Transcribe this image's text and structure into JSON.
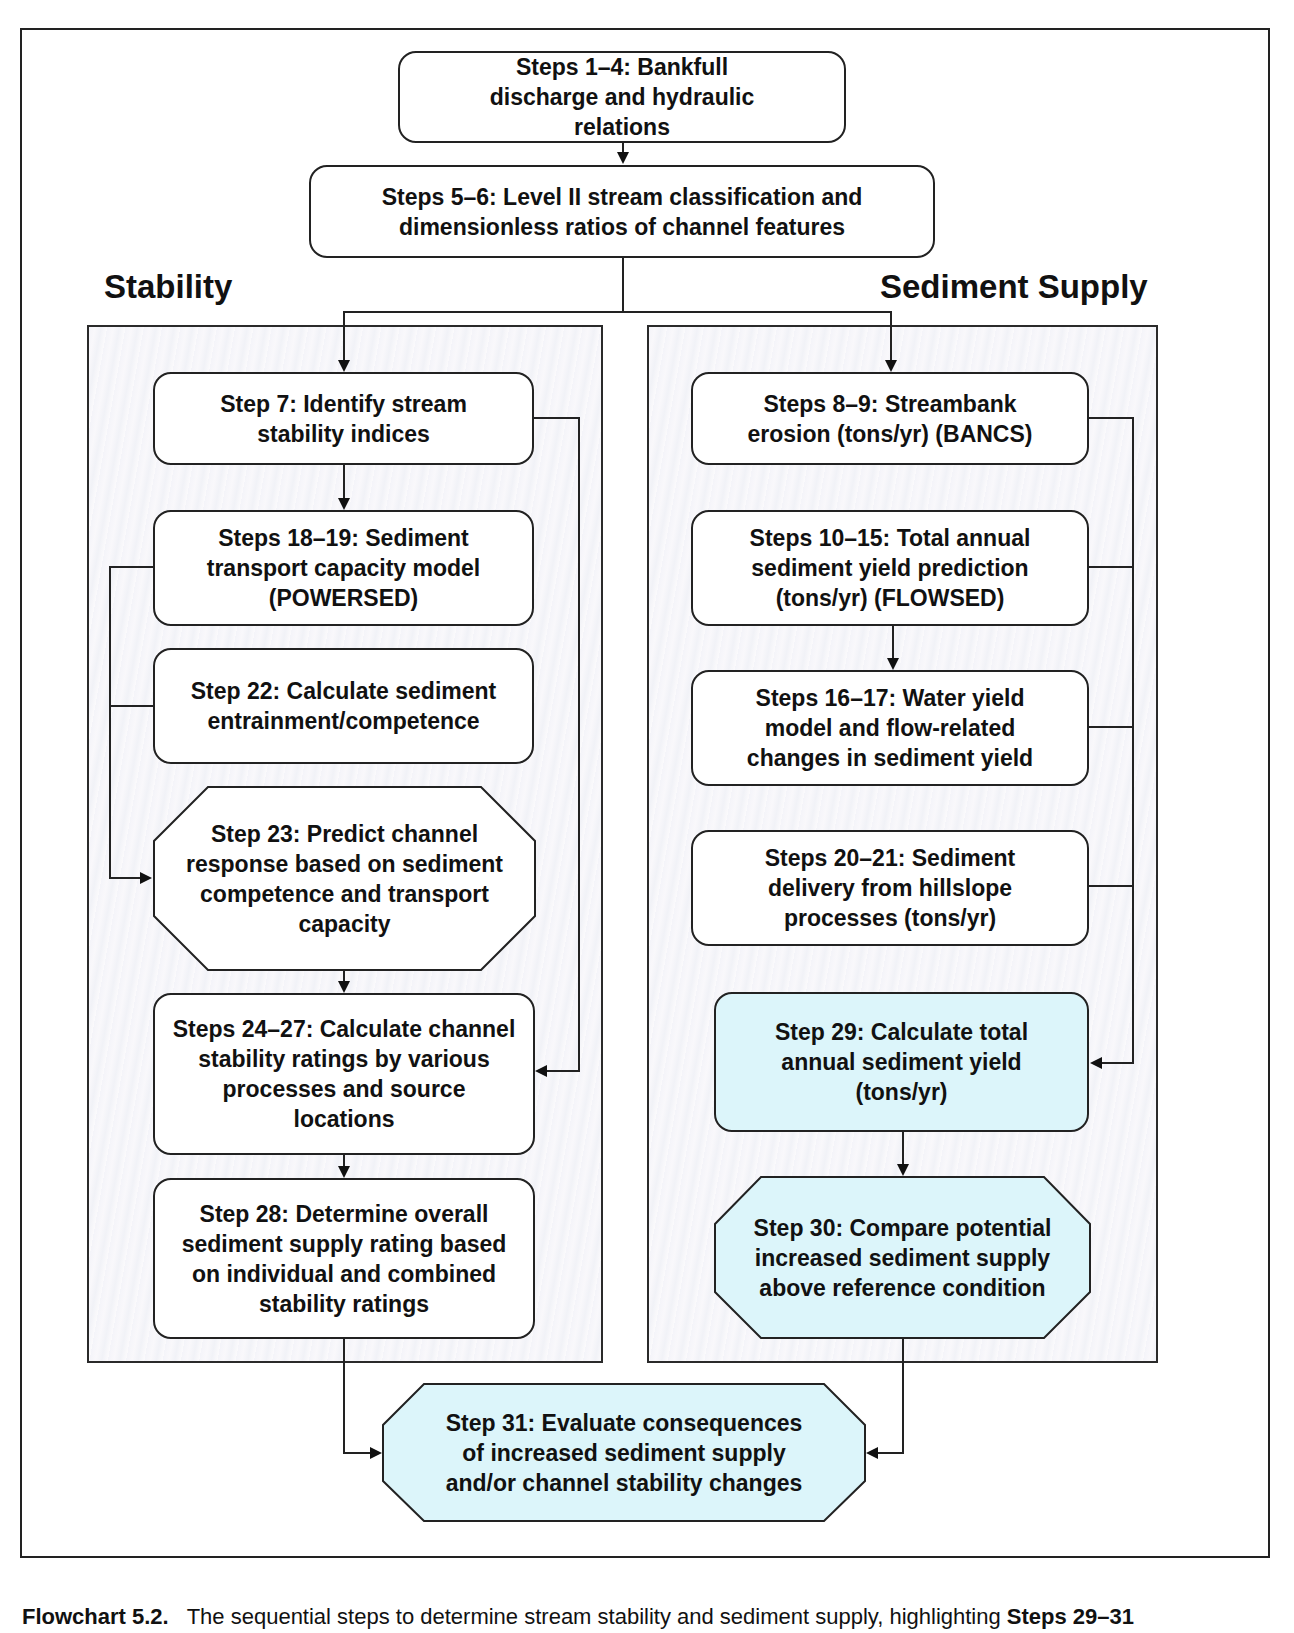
{
  "diagram": {
    "colors": {
      "highlight": "#dcf5fa",
      "box": "#ffffff",
      "line": "#222222",
      "panel": "#f5f5f9"
    },
    "top": [
      {
        "id": "s1-4",
        "label": "Steps 1–4:  Bankfull discharge and hydraulic relations"
      },
      {
        "id": "s5-6",
        "label": "Steps 5–6:  Level II stream classification and dimensionless ratios of channel features"
      }
    ],
    "stability": {
      "title": "Stability",
      "steps": [
        {
          "id": "s7",
          "label": "Step 7:  Identify stream stability indices"
        },
        {
          "id": "s18-19",
          "label": "Steps 18–19:  Sediment transport capacity model (POWERSED)"
        },
        {
          "id": "s22",
          "label": "Step 22:  Calculate sediment entrainment/competence"
        },
        {
          "id": "s23",
          "label": "Step 23:  Predict channel response based on sediment competence and transport capacity"
        },
        {
          "id": "s24-27",
          "label": "Steps 24–27:  Calculate channel stability ratings by various processes and source locations"
        },
        {
          "id": "s28",
          "label": "Step 28:  Determine overall sediment supply rating based on individual and combined stability ratings"
        }
      ]
    },
    "sediment_supply": {
      "title": "Sediment Supply",
      "steps": [
        {
          "id": "s8-9",
          "label": "Steps 8–9:  Streambank erosion (tons/yr) (BANCS)"
        },
        {
          "id": "s10-15",
          "label": "Steps 10–15:  Total annual sediment yield prediction (tons/yr) (FLOWSED)"
        },
        {
          "id": "s16-17",
          "label": "Steps 16–17:  Water yield model and flow-related changes in sediment yield"
        },
        {
          "id": "s20-21",
          "label": "Steps 20–21:  Sediment delivery from hillslope processes (tons/yr)"
        },
        {
          "id": "s29",
          "label": "Step 29:  Calculate total annual sediment yield (tons/yr)"
        },
        {
          "id": "s30",
          "label": "Step 30:  Compare potential increased sediment supply above reference condition"
        }
      ]
    },
    "final": {
      "id": "s31",
      "label": "Step 31:  Evaluate consequences of increased sediment supply and/or channel stability changes"
    }
  },
  "caption": {
    "prefix": "Flowchart 5.2.",
    "text": "The sequential steps to determine stream stability and sediment supply, highlighting",
    "bold_suffix": "Steps 29–31"
  }
}
